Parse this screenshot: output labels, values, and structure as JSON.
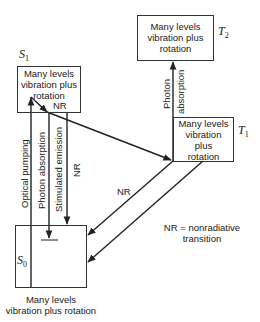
{
  "diagram": {
    "type": "Jablonski energy-level diagram",
    "states": {
      "S1": {
        "symbol": "S",
        "subscript": "1",
        "description": "Many levels vibration plus rotation"
      },
      "T2": {
        "symbol": "T",
        "subscript": "2",
        "description": "Many levels vibration plus rotation"
      },
      "T1": {
        "symbol": "T",
        "subscript": "1",
        "description": "Many levels vibration plus rotation"
      },
      "S0": {
        "symbol": "S",
        "subscript": "0",
        "description": "Many levels vibration plus rotation"
      }
    },
    "box_text": {
      "s1_line1": "Many levels",
      "s1_line2": "vibration plus",
      "s1_line3": "rotation",
      "t2_line1": "Many levels",
      "t2_line2": "vibration plus",
      "t2_line3": "rotation",
      "t1_line1": "Many levels",
      "t1_line2": "vibration",
      "t1_line3": "plus",
      "t1_line4": "rotation",
      "s0_line1": "Many levels",
      "s0_line2": "vibration plus rotation"
    },
    "transitions": {
      "optical_pumping": "Optical pumping",
      "photon_absorption_s": "Photon absorption",
      "stimulated_emission": "Stimulated emission",
      "nr_s1_s0": "NR",
      "nr_s1_internal": "NR",
      "photon_absorption_t_1": "Photon",
      "photon_absorption_t_2": "absorption",
      "nr_t1_s0": "NR"
    },
    "legend": {
      "line1": "NR = nonradiative",
      "line2": "transition"
    },
    "colors": {
      "line": "#222222",
      "background": "#ffffff"
    }
  }
}
